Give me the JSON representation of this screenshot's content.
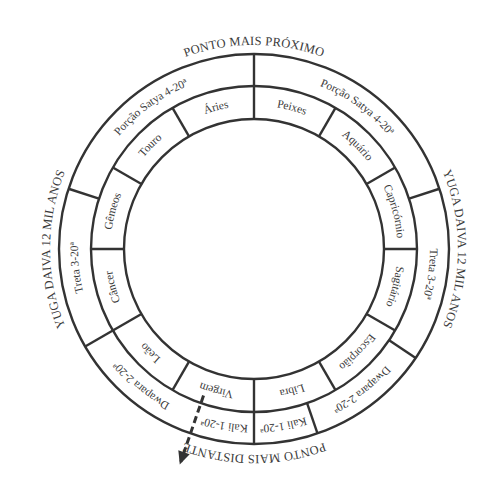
{
  "diagram": {
    "top_label": "PONTO MAIS PRÓXIMO",
    "bottom_label": "PONTO MAIS DISTANTE",
    "left_label": "YUGA DAIVA 12 MIL ANOS",
    "right_label": "YUGA DAIVA 12 MIL ANOS",
    "outer_ring": [
      {
        "label": "Porção Satya 4-20ª",
        "start": 90,
        "end": 162
      },
      {
        "label": "Treta 3-20ª",
        "start": 162,
        "end": 210
      },
      {
        "label": "Dwapara 2-20ª",
        "start": 210,
        "end": 251
      },
      {
        "label": "Kali 1-20ª",
        "start": 251,
        "end": 270
      },
      {
        "label": "Kali 1-20ª",
        "start": 270,
        "end": 289
      },
      {
        "label": "Dwapara 2-20ª",
        "start": 289,
        "end": 326
      },
      {
        "label": "Treta 3-20ª",
        "start": 326,
        "end": 378
      },
      {
        "label": "Porção Satya 4-20ª",
        "start": 378,
        "end": 450
      }
    ],
    "inner_ring": [
      "Áries",
      "Touro",
      "Gêmeos",
      "Câncer",
      "Leão",
      "Virgem",
      "Libra",
      "Escorpião",
      "Sagitário",
      "Capricórnio",
      "Aquário",
      "Peixes"
    ],
    "arrow": {
      "style": "dashed",
      "direction": "down-left"
    }
  }
}
